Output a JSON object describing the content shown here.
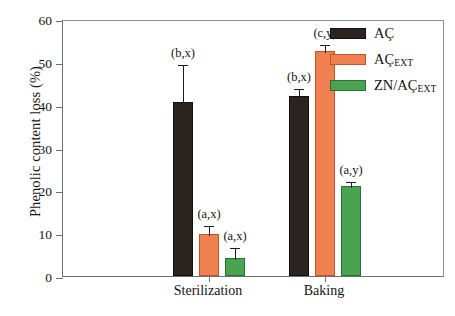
{
  "chart_data": {
    "type": "bar",
    "title": "",
    "xlabel": "",
    "ylabel": "Phenolic content loss (%)",
    "ylim": [
      0,
      60
    ],
    "ytick_labels": [
      "0",
      "10",
      "20",
      "30",
      "40",
      "50",
      "60"
    ],
    "ytick_values": [
      0,
      10,
      20,
      30,
      40,
      50,
      60
    ],
    "grid": false,
    "legend_position": "top-right",
    "categories": [
      "Sterilization",
      "Baking"
    ],
    "series": [
      {
        "name": "AÇ",
        "name_base": "AÇ",
        "name_sub": "",
        "color": "#2b2320",
        "values": [
          40.7,
          42.0
        ],
        "errors": [
          9.1,
          2.2
        ],
        "annotations": [
          "(b,x)",
          "(b,x)"
        ]
      },
      {
        "name": "AÇEXT",
        "name_base": "AÇ",
        "name_sub": "EXT",
        "color": "#f0804f",
        "values": [
          9.8,
          52.6
        ],
        "errors": [
          2.4,
          1.9
        ],
        "annotations": [
          "(a,x)",
          "(c,y)"
        ]
      },
      {
        "name": "ZN/AÇEXT",
        "name_base": "ZN/AÇ",
        "name_sub": "EXT",
        "color": "#49a351",
        "values": [
          4.2,
          21.0
        ],
        "errors": [
          2.8,
          1.5
        ],
        "annotations": [
          "(a,x)",
          "(a,y)"
        ]
      }
    ]
  },
  "axes": {
    "y_title": "Phenolic content loss (%)",
    "y_ticks": [
      {
        "label": "60",
        "value": 60
      },
      {
        "label": "50",
        "value": 50
      },
      {
        "label": "40",
        "value": 40
      },
      {
        "label": "30",
        "value": 30
      },
      {
        "label": "20",
        "value": 20
      },
      {
        "label": "10",
        "value": 10
      },
      {
        "label": "0",
        "value": 0
      }
    ],
    "x_groups": [
      {
        "label": "Sterilization"
      },
      {
        "label": "Baking"
      }
    ]
  },
  "legend": {
    "items": [
      {
        "label": "AÇ",
        "base": "AÇ",
        "sub": "",
        "swatch": "dark",
        "color": "#2b2320"
      },
      {
        "label": "AÇEXT",
        "base": "AÇ",
        "sub": "EXT",
        "swatch": "orange",
        "color": "#f0804f"
      },
      {
        "label": "ZN/AÇEXT",
        "base": "ZN/AÇ",
        "sub": "EXT",
        "swatch": "green",
        "color": "#49a351"
      }
    ]
  },
  "annotations": {
    "sterilization": [
      "(b,x)",
      "(a,x)",
      "(a,x)"
    ],
    "baking": [
      "(b,x)",
      "(c,y)",
      "(a,y)"
    ]
  }
}
